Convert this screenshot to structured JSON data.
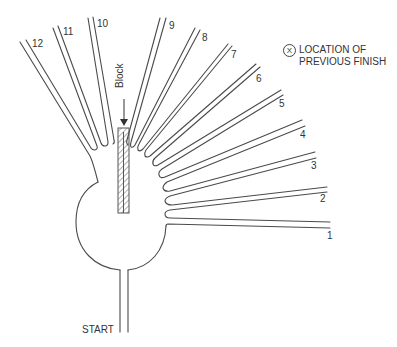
{
  "diagram": {
    "type": "radial-arm-maze",
    "arm_count": 12,
    "arms": [
      {
        "id": 1,
        "label": "1"
      },
      {
        "id": 2,
        "label": "2"
      },
      {
        "id": 3,
        "label": "3"
      },
      {
        "id": 4,
        "label": "4"
      },
      {
        "id": 5,
        "label": "5"
      },
      {
        "id": 6,
        "label": "6"
      },
      {
        "id": 7,
        "label": "7"
      },
      {
        "id": 8,
        "label": "8"
      },
      {
        "id": 9,
        "label": "9"
      },
      {
        "id": 10,
        "label": "10"
      },
      {
        "id": 11,
        "label": "11"
      },
      {
        "id": 12,
        "label": "12"
      }
    ],
    "start_label": "START",
    "block_label": "Block",
    "legend": {
      "symbol": "X",
      "line1": "LOCATION OF",
      "line2": "PREVIOUS FINISH"
    }
  }
}
